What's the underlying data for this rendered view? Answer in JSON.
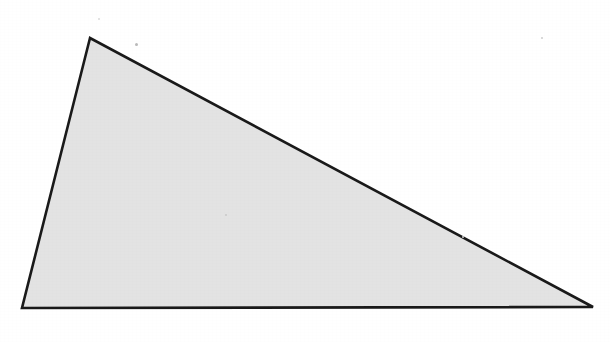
{
  "figure": {
    "title": "Scalene triangle",
    "caption": "",
    "background_color": "#ffffff",
    "canvas": {
      "width": 610,
      "height": 342
    }
  },
  "shape": {
    "kind": "triangle",
    "name": "scalene-triangle",
    "fill_color": "#e3e3e3",
    "stroke_color": "#1a1a1a",
    "stroke_width": 2.6,
    "vertices": [
      {
        "label": "apex",
        "x": 90,
        "y": 38
      },
      {
        "label": "bottom-left",
        "x": 22,
        "y": 308
      },
      {
        "label": "bottom-right",
        "x": 593,
        "y": 307
      }
    ],
    "points_attr": "90,38 22,308 593,307",
    "edges": [
      {
        "name": "left-edge",
        "from": "apex",
        "to": "bottom-left"
      },
      {
        "name": "bottom-edge",
        "from": "bottom-left",
        "to": "bottom-right"
      },
      {
        "name": "hypotenuse",
        "from": "apex",
        "to": "bottom-right"
      }
    ]
  },
  "artifacts": {
    "specks": [
      {
        "name": "speck-upper",
        "x": 135,
        "y": 43,
        "size": 3,
        "color": "#b9b9b9"
      },
      {
        "name": "speck-right",
        "x": 541,
        "y": 37,
        "size": 2,
        "color": "#cccccc"
      },
      {
        "name": "speck-mid",
        "x": 225,
        "y": 214,
        "size": 2,
        "color": "#c8c8c8"
      },
      {
        "name": "speck-lower-right",
        "x": 462,
        "y": 236,
        "size": 2,
        "color": "#d0d0d0"
      },
      {
        "name": "speck-top-left",
        "x": 98,
        "y": 18,
        "size": 2,
        "color": "#dadada"
      }
    ]
  }
}
